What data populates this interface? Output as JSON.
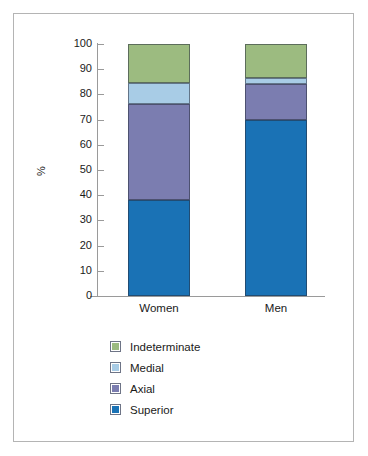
{
  "chart_data": {
    "type": "bar",
    "subtype": "stacked-bar-100",
    "title": "",
    "xlabel": "",
    "ylabel": "%",
    "ylim": [
      0,
      100
    ],
    "yticks": [
      0,
      10,
      20,
      30,
      40,
      50,
      60,
      70,
      80,
      90,
      100
    ],
    "grid": false,
    "legend_position": "bottom-left",
    "categories": [
      "Women",
      "Men"
    ],
    "series": [
      {
        "name": "Superior",
        "color": "#1a72b5",
        "values": [
          38,
          70
        ]
      },
      {
        "name": "Axial",
        "color": "#7b7db0",
        "values": [
          38,
          14
        ]
      },
      {
        "name": "Medial",
        "color": "#a8cce6",
        "values": [
          8.5,
          2.5
        ]
      },
      {
        "name": "Indeterminate",
        "color": "#9cbb80",
        "values": [
          15.5,
          13.5
        ]
      }
    ],
    "stack_order_bottom_to_top": [
      "Superior",
      "Axial",
      "Medial",
      "Indeterminate"
    ],
    "cumulative_tops": {
      "Women": {
        "Superior": 38,
        "Axial": 76,
        "Medial": 84.5,
        "Indeterminate": 100
      },
      "Men": {
        "Superior": 70,
        "Axial": 84,
        "Medial": 86.5,
        "Indeterminate": 100
      }
    }
  },
  "axis": {
    "y_title": "%",
    "y_tick_labels": [
      "100",
      "90",
      "80",
      "70",
      "60",
      "50",
      "40",
      "30",
      "20",
      "10",
      "0"
    ],
    "x_tick_labels": [
      "Women",
      "Men"
    ]
  },
  "legend": {
    "items": [
      {
        "label": "Indeterminate",
        "color": "#9cbb80"
      },
      {
        "label": "Medial",
        "color": "#a8cce6"
      },
      {
        "label": "Axial",
        "color": "#7b7db0"
      },
      {
        "label": "Superior",
        "color": "#1a72b5"
      }
    ]
  },
  "colors": {
    "indeterminate": "#9cbb80",
    "medial": "#a8cce6",
    "axial": "#7b7db0",
    "superior": "#1a72b5",
    "axis": "#9a9a9a",
    "frame": "#b4b4b4",
    "background": "#ffffff",
    "text": "#1a1a1a"
  }
}
